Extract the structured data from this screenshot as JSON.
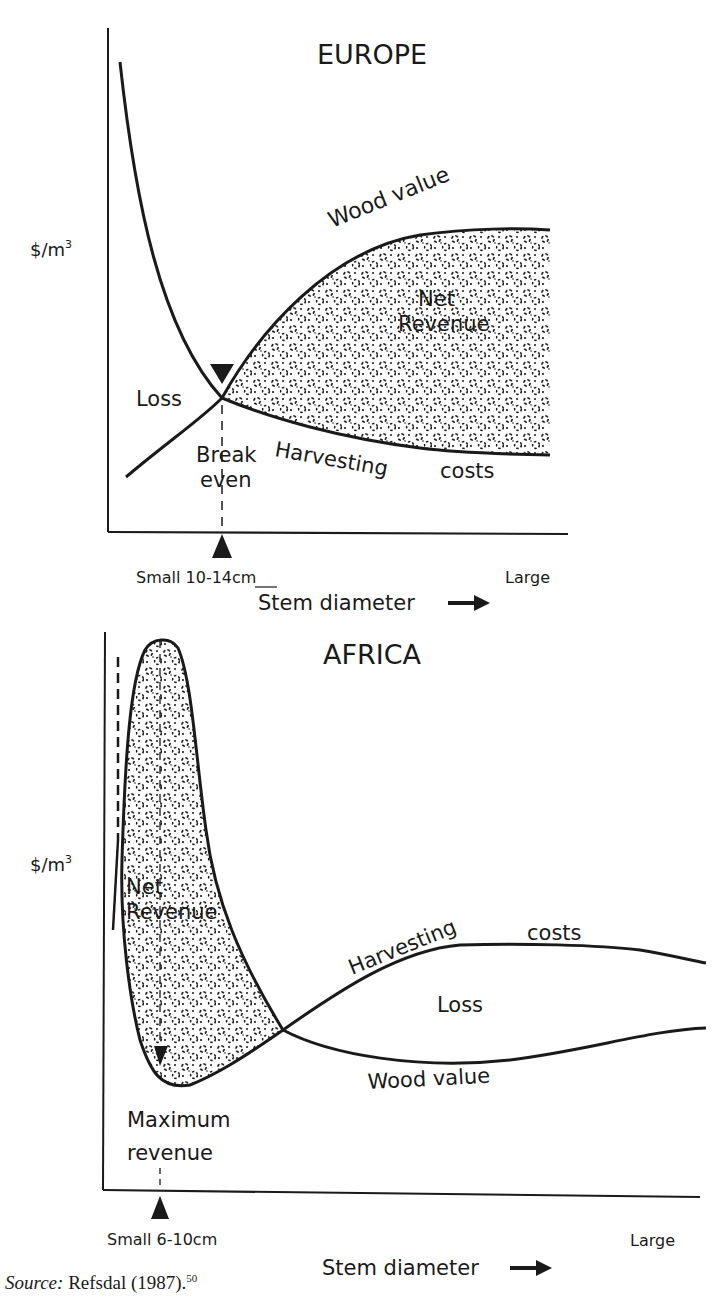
{
  "top_fragment": "(top line cut off)",
  "europe": {
    "title": "EUROPE",
    "y_label": "$/m",
    "y_label_sup": "3",
    "curves": {
      "wood_value": "Wood value",
      "harvesting_costs_1": "Harvesting",
      "harvesting_costs_2": "costs"
    },
    "regions": {
      "net": "Net",
      "revenue": "Revenue",
      "loss": "Loss"
    },
    "break_even": [
      "Break",
      "even"
    ],
    "x_small": "Small 10-14cm",
    "x_large": "Large",
    "x_label": "Stem diameter"
  },
  "africa": {
    "title": "AFRICA",
    "y_label": "$/m",
    "y_label_sup": "3",
    "curves": {
      "harvesting_1": "Harvesting",
      "harvesting_2": "costs",
      "wood_value": "Wood value"
    },
    "regions": {
      "net": "Net",
      "revenue": "Revenue",
      "loss": "Loss"
    },
    "max_revenue": [
      "Maximum",
      "revenue"
    ],
    "x_small": "Small 6-10cm",
    "x_large": "Large",
    "x_label": "Stem diameter"
  },
  "source": {
    "label": "Source:",
    "text": " Refsdal (1987).",
    "ref": "50"
  },
  "colors": {
    "ink": "#1a1a1a",
    "background": "#ffffff"
  }
}
